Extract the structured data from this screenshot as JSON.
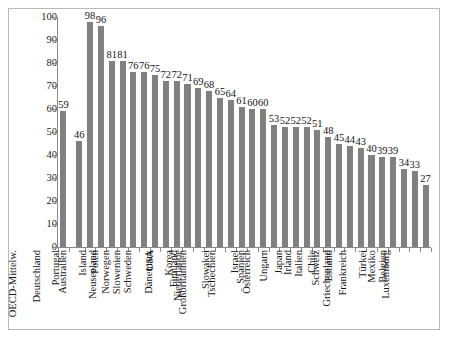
{
  "chart_data": {
    "type": "bar",
    "title": "",
    "subtitle": "",
    "xlabel": "",
    "ylabel": "",
    "ylim": [
      0,
      100
    ],
    "ytick_step": 10,
    "yticks": [
      100,
      90,
      80,
      70,
      60,
      50,
      40,
      30,
      20,
      10,
      0
    ],
    "grid": false,
    "legend": false,
    "bar_color": "#808080",
    "axis_color": "#8a8a8a",
    "border_color": "#b9b9b9",
    "value_labels_shown": true,
    "separator_after_index": 0,
    "categories": [
      "OECD-Mittelw.",
      "Deutschland",
      "Portugal",
      "Australien",
      "Island",
      "Polen",
      "Neuseeland",
      "Norwegen",
      "Slowenien",
      "Schweden",
      "USA",
      "Dänemark",
      "Korea",
      "Finnland",
      "Niederlande",
      "Großbritannien",
      "Slowakei",
      "Tschechien",
      "Israel",
      "Spanien",
      "Österreich",
      "Ungarn",
      "Japan",
      "Irland",
      "Italien",
      "Chile",
      "Schweiz",
      "Estland",
      "Griechenland",
      "Frankreich",
      "Türkei",
      "Mexiko",
      "Belgien",
      "Luxemburg"
    ],
    "values": [
      59,
      46,
      98,
      96,
      81,
      81,
      76,
      76,
      75,
      72,
      72,
      71,
      69,
      68,
      65,
      64,
      61,
      60,
      60,
      53,
      52,
      52,
      52,
      51,
      48,
      45,
      44,
      43,
      40,
      39,
      39,
      34,
      33,
      27
    ]
  }
}
